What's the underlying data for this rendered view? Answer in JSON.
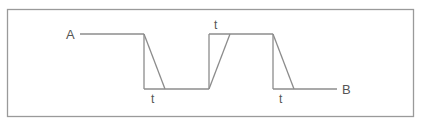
{
  "diagram": {
    "type": "timing-waveform",
    "frame": {
      "x": 7,
      "y": 9,
      "width": 407,
      "height": 108,
      "stroke": "#9a9a9a"
    },
    "colors": {
      "line": "#8c8c8c",
      "text": "#555555"
    },
    "labels": {
      "start": "A",
      "end": "B",
      "t1": "t",
      "t2": "t",
      "t3": "t"
    },
    "levels": {
      "high_y": 34,
      "low_y": 89
    },
    "edges": [
      {
        "kind": "fall",
        "ideal_x": 144,
        "slope_end_x": 165,
        "label_key": "t1"
      },
      {
        "kind": "rise",
        "ideal_x": 209,
        "slope_end_x": 230,
        "label_key": "t2"
      },
      {
        "kind": "fall",
        "ideal_x": 273,
        "slope_end_x": 294,
        "label_key": "t3"
      }
    ]
  }
}
